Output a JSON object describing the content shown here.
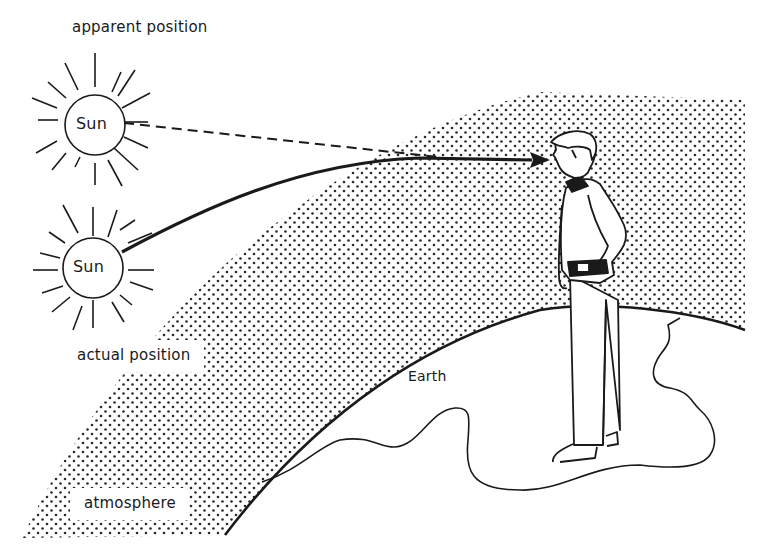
{
  "diagram": {
    "labels": {
      "apparent_position": "apparent position",
      "actual_position": "actual position",
      "sun_apparent": "Sun",
      "sun_actual": "Sun",
      "earth": "Earth",
      "atmosphere": "atmosphere"
    },
    "elements": {
      "apparent_sun": {
        "cx": 95,
        "cy": 125,
        "r": 30
      },
      "actual_sun": {
        "cx": 93,
        "cy": 268,
        "r": 30
      },
      "observer": "person standing on Earth looking toward the Sun",
      "dashed_line": "line of sight to apparent position",
      "curved_arrow": "refracted light path from actual position to observer"
    },
    "colors": {
      "ink": "#1a1a1a",
      "background": "#ffffff",
      "stipple": "#2a2a2a"
    }
  }
}
